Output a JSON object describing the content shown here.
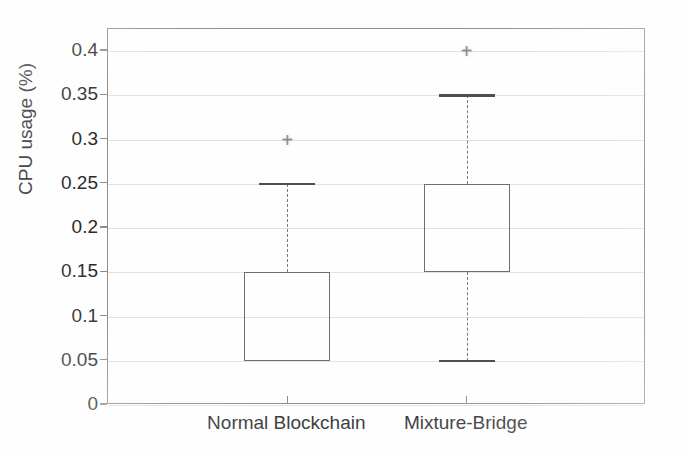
{
  "chart_data": {
    "type": "box",
    "title": "",
    "xlabel": "",
    "ylabel": "CPU usage (%)",
    "ylim": [
      0,
      0.425
    ],
    "ytick_labels": [
      "0",
      "0.05",
      "0.1",
      "0.15",
      "0.2",
      "0.25",
      "0.3",
      "0.35",
      "0.4"
    ],
    "ytick_values": [
      0,
      0.05,
      0.1,
      0.15,
      0.2,
      0.25,
      0.3,
      0.35,
      0.4
    ],
    "grid": true,
    "legend": "none",
    "categories": [
      "Normal Blockchain",
      "Mixture-Bridge"
    ],
    "boxes": [
      {
        "category": "Normal Blockchain",
        "q1": 0.05,
        "median": 0.05,
        "q3": 0.15,
        "whisker_low": 0.05,
        "whisker_high": 0.25,
        "outliers": [
          0.3
        ]
      },
      {
        "category": "Mixture-Bridge",
        "q1": 0.15,
        "median": 0.15,
        "q3": 0.25,
        "whisker_low": 0.05,
        "whisker_high": 0.35,
        "outliers": [
          0.4
        ]
      }
    ],
    "colors": {
      "box_edge": "#6e6e6e",
      "whisker": "#7a7a7a",
      "cap": "#4f4f4f",
      "outlier": "#8a8a8a",
      "gridline": "#e2e2e2",
      "axis": "#8d8d8d",
      "text": "#2b2b2b",
      "background": "#fefefe"
    },
    "outlier_marker": "+"
  }
}
